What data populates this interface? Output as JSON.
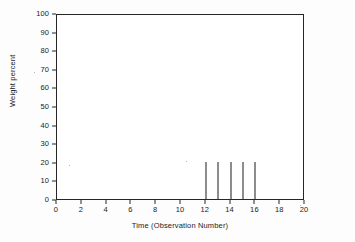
{
  "chart_data": {
    "type": "bar",
    "title": "",
    "subtitle": "",
    "xlabel": "Time (Observation Number)",
    "ylabel": "Weight percent",
    "xlim": [
      0,
      20
    ],
    "ylim": [
      0,
      100
    ],
    "grid": false,
    "legend": false,
    "legend_position": "none",
    "x_ticks": [
      0,
      2,
      4,
      6,
      8,
      10,
      12,
      14,
      16,
      18,
      20
    ],
    "y_ticks": [
      0,
      10,
      20,
      30,
      40,
      50,
      60,
      70,
      80,
      90,
      100
    ],
    "x_tick_labels": [
      "0",
      "2",
      "4",
      "6",
      "8",
      "10",
      "12",
      "14",
      "16",
      "18",
      "20"
    ],
    "y_tick_labels": [
      "0",
      "10",
      "20",
      "30",
      "40",
      "50",
      "60",
      "70",
      "80",
      "90",
      "100"
    ],
    "x": [
      12,
      13,
      14,
      15,
      16
    ],
    "values": [
      20,
      20,
      20,
      20,
      20
    ],
    "categories": [
      "12",
      "13",
      "14",
      "15",
      "16"
    ],
    "series": [
      {
        "name": "Weight percent",
        "x": [
          12,
          13,
          14,
          15,
          16
        ],
        "values": [
          20,
          20,
          20,
          20,
          20
        ]
      }
    ],
    "annotations": []
  },
  "style": {
    "axis_color": "#262626",
    "data_color": "#1c1c1c",
    "background": "#ffffff",
    "page_background": "#fdfdfd"
  }
}
